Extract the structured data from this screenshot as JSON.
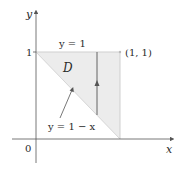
{
  "diagram": {
    "axes": {
      "x_label": "x",
      "y_label": "y",
      "origin_label": "0",
      "y_tick_label": "1"
    },
    "region": {
      "name": "D",
      "fill_color": "#ececec",
      "edge_color": "#d0d0d0"
    },
    "curves": {
      "top_label": "y = 1",
      "bottom_label": "y = 1 − x"
    },
    "point": {
      "label": "(1, 1)"
    },
    "colors": {
      "axis": "#555555",
      "text": "#2a2a2a"
    }
  }
}
